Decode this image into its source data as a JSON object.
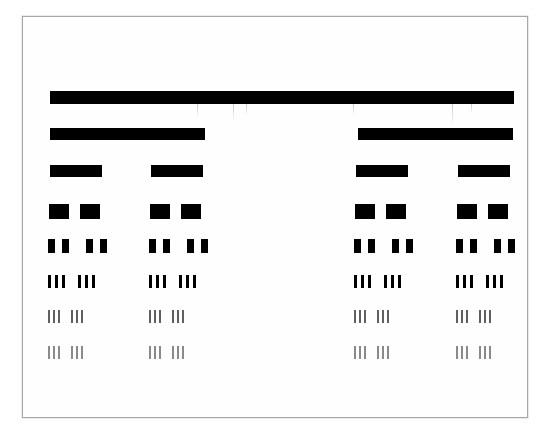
{
  "document": {
    "kind": "resolution-test-target",
    "description": "Scanned bar-pattern resolution test chart with eight rows of black bars of decreasing width and increasing spatial frequency",
    "background_color": "#ffffff",
    "paper_color": "#fefefe",
    "bar_color": "#000000",
    "frame_color": "#a8a8a8"
  },
  "frame": {
    "x": 22,
    "y": 16,
    "width": 506,
    "height": 402,
    "border_width": 1
  },
  "chart_data": {
    "type": "bar",
    "xlabel": "",
    "ylabel": "",
    "units": "pixels",
    "rows": [
      {
        "index": 1,
        "name": "row-1-single-wide-bar",
        "y": 90,
        "bar_height": 13,
        "bar_width": 464,
        "bar_gap": 0,
        "bars_per_group": 1,
        "groups": [
          {
            "x": 49,
            "opacity": 1.0
          }
        ],
        "opacity": 1.0
      },
      {
        "index": 2,
        "name": "row-2-two-wide-bars",
        "y": 127,
        "bar_height": 12,
        "bar_width": 155,
        "bar_gap": 0,
        "bars_per_group": 1,
        "groups": [
          {
            "x": 49,
            "opacity": 1.0
          },
          {
            "x": 357,
            "opacity": 1.0
          }
        ],
        "opacity": 1.0
      },
      {
        "index": 3,
        "name": "row-3-four-medium-bars",
        "y": 164,
        "bar_height": 12,
        "bar_width": 52,
        "bar_gap": 0,
        "bars_per_group": 1,
        "groups": [
          {
            "x": 49,
            "opacity": 1.0
          },
          {
            "x": 150,
            "opacity": 1.0
          },
          {
            "x": 355,
            "opacity": 1.0
          },
          {
            "x": 457,
            "opacity": 1.0
          }
        ],
        "opacity": 1.0
      },
      {
        "index": 4,
        "name": "row-4-squares-pairs",
        "y": 203,
        "bar_height": 15,
        "bar_width": 20,
        "bar_gap": 11,
        "bars_per_group": 2,
        "groups": [
          {
            "x": 48,
            "opacity": 1.0
          },
          {
            "x": 149,
            "opacity": 1.0
          },
          {
            "x": 354,
            "opacity": 1.0
          },
          {
            "x": 456,
            "opacity": 1.0
          }
        ],
        "opacity": 1.0
      },
      {
        "index": 5,
        "name": "row-5-double-narrow-bars",
        "y": 238,
        "bar_height": 14,
        "bar_width": 7,
        "bar_gap": 7,
        "bars_per_group": 2,
        "group_inner_gap": 17,
        "subgroups_per_group": 2,
        "groups": [
          {
            "x": 47,
            "opacity": 1.0
          },
          {
            "x": 148,
            "opacity": 1.0
          },
          {
            "x": 353,
            "opacity": 1.0
          },
          {
            "x": 455,
            "opacity": 1.0
          }
        ],
        "opacity": 1.0
      },
      {
        "index": 6,
        "name": "row-6-triple-thin-bars",
        "y": 274,
        "bar_height": 13,
        "bar_width": 3,
        "bar_gap": 4,
        "bars_per_group": 3,
        "group_inner_gap": 13,
        "subgroups_per_group": 2,
        "groups": [
          {
            "x": 47,
            "opacity": 1.0
          },
          {
            "x": 148,
            "opacity": 1.0
          },
          {
            "x": 353,
            "opacity": 1.0
          },
          {
            "x": 455,
            "opacity": 1.0
          }
        ],
        "opacity": 1.0
      },
      {
        "index": 7,
        "name": "row-7-triple-finer-bars",
        "y": 309,
        "bar_height": 13,
        "bar_width": 2,
        "bar_gap": 3,
        "bars_per_group": 3,
        "group_inner_gap": 11,
        "subgroups_per_group": 2,
        "groups": [
          {
            "x": 47,
            "opacity": 0.62
          },
          {
            "x": 148,
            "opacity": 0.62
          },
          {
            "x": 353,
            "opacity": 0.62
          },
          {
            "x": 455,
            "opacity": 0.62
          }
        ],
        "opacity": 0.62
      },
      {
        "index": 8,
        "name": "row-8-triple-finest-bars",
        "y": 345,
        "bar_height": 13,
        "bar_width": 2,
        "bar_gap": 3,
        "bars_per_group": 3,
        "group_inner_gap": 11,
        "subgroups_per_group": 2,
        "groups": [
          {
            "x": 47,
            "opacity": 0.45
          },
          {
            "x": 148,
            "opacity": 0.45
          },
          {
            "x": 353,
            "opacity": 0.45
          },
          {
            "x": 455,
            "opacity": 0.45
          }
        ],
        "opacity": 0.45
      }
    ],
    "row_count": 8,
    "grid": false,
    "legend": "none"
  },
  "scan_artifacts": [
    {
      "x": 196,
      "y": 103,
      "width": 1,
      "height": 14,
      "name": "scan-streak-1"
    },
    {
      "x": 232,
      "y": 103,
      "width": 1,
      "height": 18,
      "name": "scan-streak-2"
    },
    {
      "x": 245,
      "y": 103,
      "width": 1,
      "height": 11,
      "name": "scan-streak-3"
    },
    {
      "x": 352,
      "y": 103,
      "width": 1,
      "height": 12,
      "name": "scan-streak-4"
    },
    {
      "x": 451,
      "y": 103,
      "width": 1,
      "height": 22,
      "name": "scan-streak-5"
    },
    {
      "x": 470,
      "y": 103,
      "width": 1,
      "height": 9,
      "name": "scan-streak-6"
    }
  ]
}
